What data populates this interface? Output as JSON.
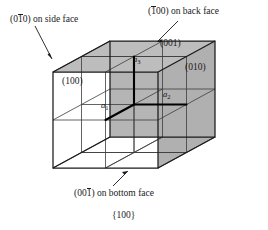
{
  "figure": {
    "caption": "{100}",
    "projection": "oblique-cube",
    "cube": {
      "subdivisions": 2,
      "front_face": {
        "x": 53,
        "y": 72,
        "w": 105,
        "h": 96
      },
      "depth_offset": {
        "dx": 57,
        "dy": -31
      }
    },
    "colors": {
      "shaded_face": "#b8b8b8",
      "shaded_face_dark": "#ababab",
      "line": "#1a1a1a",
      "grid_line": "#4a4a4a",
      "axis": "#000000",
      "background": "#ffffff"
    }
  },
  "face_labels": [
    {
      "name": "front-face-label",
      "text": "(100)",
      "x": 62,
      "y": 80
    },
    {
      "name": "top-face-label",
      "text": "(001)",
      "x": 160,
      "y": 42
    },
    {
      "name": "right-face-label",
      "text": "(010)",
      "x": 185,
      "y": 66
    }
  ],
  "callouts": {
    "side_face": {
      "prefix": "(0",
      "bar": "1",
      "suffix": "0) on side face",
      "full_text": "(010) on side face",
      "x": 10,
      "y": 14
    },
    "back_face": {
      "prefix": "(",
      "bar": "1",
      "suffix": "00) on back face",
      "full_text": "(100) on back face",
      "x": 163,
      "y": 8
    },
    "bottom_face": {
      "prefix": "(00",
      "bar": "1",
      "suffix": ") on bottom face",
      "full_text": "(001) on bottom face",
      "x": 80,
      "y": 190
    }
  },
  "axes": [
    {
      "name": "axis-label-a1",
      "base": "a",
      "sub": "1",
      "x": 102,
      "y": 102
    },
    {
      "name": "axis-label-a2",
      "base": "a",
      "sub": "2",
      "x": 163,
      "y": 91
    },
    {
      "name": "axis-label-a3",
      "base": "a",
      "sub": "3",
      "x": 133,
      "y": 56
    }
  ]
}
